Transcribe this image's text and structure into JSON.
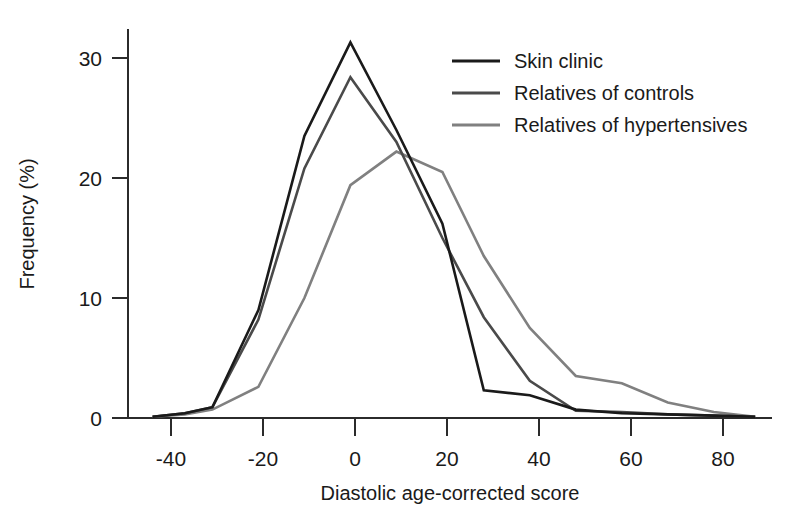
{
  "chart_data": {
    "type": "line",
    "title": "",
    "xlabel": "Diastolic age-corrected score",
    "ylabel": "Frequency (%)",
    "xlim": [
      -47,
      88
    ],
    "ylim": [
      0,
      33
    ],
    "xticks": [
      -40,
      -20,
      0,
      20,
      40,
      60,
      80
    ],
    "xtick_labels": [
      "-40",
      "-20",
      "0",
      "20",
      "40",
      "60",
      "80"
    ],
    "yticks": [
      0,
      10,
      20,
      30
    ],
    "ytick_labels": [
      "0",
      "10",
      "20",
      "30"
    ],
    "grid": false,
    "legend_position": "top-right",
    "series": [
      {
        "name": "Skin clinic",
        "color": "#1a1a1a",
        "linewidth": 2.6,
        "x": [
          -44,
          -37,
          -31,
          -21,
          -11,
          -1,
          9,
          19,
          28,
          38,
          48,
          58,
          68,
          78,
          87
        ],
        "y": [
          0.1,
          0.4,
          0.9,
          9.0,
          23.5,
          31.3,
          24.0,
          16.2,
          2.3,
          1.9,
          0.7,
          0.4,
          0.3,
          0.2,
          0.1
        ]
      },
      {
        "name": "Relatives of controls",
        "color": "#4a4a4a",
        "linewidth": 2.6,
        "x": [
          -44,
          -37,
          -31,
          -21,
          -11,
          -1,
          9,
          19,
          28,
          38,
          48,
          58,
          68,
          78,
          87
        ],
        "y": [
          0.1,
          0.4,
          0.9,
          8.2,
          20.8,
          28.4,
          23.0,
          15.0,
          8.4,
          3.1,
          0.6,
          0.5,
          0.3,
          0.2,
          0.1
        ]
      },
      {
        "name": "Relatives of hypertensives",
        "color": "#808080",
        "linewidth": 2.6,
        "x": [
          -44,
          -37,
          -31,
          -21,
          -11,
          -1,
          9,
          19,
          28,
          38,
          48,
          58,
          68,
          78,
          87
        ],
        "y": [
          0.1,
          0.3,
          0.7,
          2.6,
          10.0,
          19.4,
          22.2,
          20.5,
          13.5,
          7.5,
          3.5,
          2.9,
          1.3,
          0.5,
          0.1
        ]
      }
    ]
  },
  "legend": {
    "items": [
      {
        "label": "Skin clinic",
        "color": "#1a1a1a"
      },
      {
        "label": "Relatives of controls",
        "color": "#4a4a4a"
      },
      {
        "label": "Relatives of hypertensives",
        "color": "#808080"
      }
    ]
  },
  "axes": {
    "x_title": "Diastolic age-corrected score",
    "y_title": "Frequency (%)",
    "x_tick_labels": [
      "-40",
      "-20",
      "0",
      "20",
      "40",
      "60",
      "80"
    ],
    "y_tick_labels": [
      "0",
      "10",
      "20",
      "30"
    ]
  }
}
